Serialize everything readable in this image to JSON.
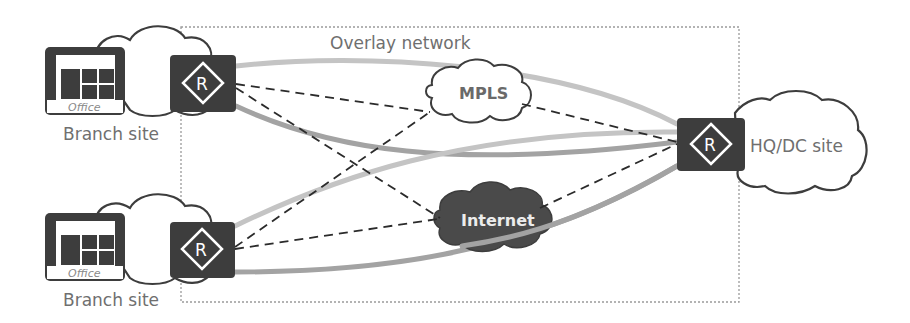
{
  "diagram": {
    "type": "network-topology",
    "overlay_label": "Overlay network",
    "nodes": {
      "branch_top": {
        "label": "Branch site",
        "office_label": "Office",
        "router_glyph": "R"
      },
      "branch_bottom": {
        "label": "Branch site",
        "office_label": "Office",
        "router_glyph": "R"
      },
      "hq": {
        "label": "HQ/DC site",
        "router_glyph": "R"
      },
      "mpls": {
        "label": "MPLS"
      },
      "internet": {
        "label": "Internet"
      }
    },
    "links": [
      {
        "from": "branch_top",
        "to": "hq",
        "style": "solid-thick",
        "color": "#bdbdbd"
      },
      {
        "from": "branch_top",
        "to": "hq",
        "style": "solid-thick",
        "color": "#9e9e9e"
      },
      {
        "from": "branch_bottom",
        "to": "hq",
        "style": "solid-thick",
        "color": "#bdbdbd"
      },
      {
        "from": "branch_bottom",
        "to": "hq",
        "style": "solid-thick",
        "color": "#9e9e9e"
      },
      {
        "from": "branch_top",
        "to": "mpls",
        "style": "dashed"
      },
      {
        "from": "branch_top",
        "to": "internet",
        "style": "dashed"
      },
      {
        "from": "branch_bottom",
        "to": "mpls",
        "style": "dashed"
      },
      {
        "from": "branch_bottom",
        "to": "internet",
        "style": "dashed"
      },
      {
        "from": "mpls",
        "to": "hq",
        "style": "dashed"
      },
      {
        "from": "internet",
        "to": "hq",
        "style": "dashed"
      }
    ],
    "colors": {
      "device_fill": "#3d3d3d",
      "cloud_outline": "#3d3d3d",
      "internet_fill": "#4a4a4a",
      "light_tunnel": "#c4c4c4",
      "dark_tunnel": "#a3a3a3",
      "dashed_line": "#2b2b2b",
      "overlay_border": "#9a9a9a",
      "label_text": "#6f6f6f"
    }
  }
}
